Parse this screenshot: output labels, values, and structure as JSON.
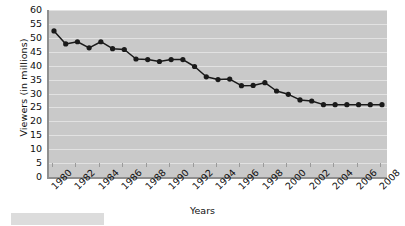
{
  "chart_data": {
    "type": "line",
    "title": "",
    "subtitle": "",
    "xlabel": "Years",
    "ylabel": "Viewers (in millions)",
    "xlim": [
      1980,
      2008
    ],
    "ylim": [
      0,
      60
    ],
    "y_ticks": [
      0,
      5,
      10,
      15,
      20,
      25,
      30,
      35,
      40,
      45,
      50,
      55,
      60
    ],
    "x_ticks": [
      1980,
      1982,
      1984,
      1986,
      1988,
      1990,
      1992,
      1994,
      1996,
      1998,
      2000,
      2002,
      2004,
      2006,
      2008
    ],
    "x_tick_labels": [
      "1980",
      "1982",
      "1984",
      "1986",
      "1988",
      "1990",
      "1992",
      "1994",
      "1996",
      "1998",
      "2000",
      "2002",
      "2004",
      "2006",
      "2008"
    ],
    "y_tick_labels": [
      "60",
      "55",
      "50",
      "45",
      "40",
      "35",
      "30",
      "25",
      "20",
      "15",
      "10",
      "5",
      "0"
    ],
    "grid": true,
    "legend": false,
    "legend_position": "none",
    "marker": "circle",
    "line_color": "#1a1a1a",
    "marker_color": "#1a1a1a",
    "plot_background": "#c9c9c9",
    "gridline_color": "#e2e2e2",
    "x": [
      1980,
      1981,
      1982,
      1983,
      1984,
      1985,
      1986,
      1987,
      1988,
      1989,
      1990,
      1991,
      1992,
      1993,
      1994,
      1995,
      1996,
      1997,
      1998,
      1999,
      2000,
      2001,
      2002,
      2003,
      2004,
      2005,
      2006,
      2007,
      2008
    ],
    "values": [
      52.5,
      47.8,
      48.6,
      46.4,
      48.6,
      46.1,
      45.8,
      42.4,
      42.2,
      41.5,
      42.2,
      42.2,
      39.7,
      36.0,
      35.0,
      35.2,
      32.8,
      32.9,
      33.9,
      30.9,
      29.7,
      27.7,
      27.3,
      26.0,
      26.0,
      26.0,
      26.0,
      26.0,
      26.0
    ],
    "series": [
      {
        "name": "Viewers",
        "x": [
          1980,
          1981,
          1982,
          1983,
          1984,
          1985,
          1986,
          1987,
          1988,
          1989,
          1990,
          1991,
          1992,
          1993,
          1994,
          1995,
          1996,
          1997,
          1998,
          1999,
          2000,
          2001,
          2002,
          2003,
          2004,
          2005,
          2006,
          2007,
          2008
        ],
        "values": [
          52.5,
          47.8,
          48.6,
          46.4,
          48.6,
          46.1,
          45.8,
          42.4,
          42.2,
          41.5,
          42.2,
          42.2,
          39.7,
          36.0,
          35.0,
          35.2,
          32.8,
          32.9,
          33.9,
          30.9,
          29.7,
          27.7,
          27.3,
          26.0,
          26.0,
          26.0,
          26.0,
          26.0,
          26.0
        ]
      }
    ]
  }
}
